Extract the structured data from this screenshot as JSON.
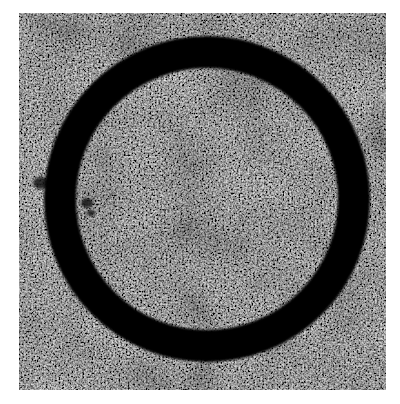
{
  "image": {
    "description": "Grayscale textured surface with a thick dark circular ring",
    "background_color": "#ffffff",
    "texture": {
      "base_color": "#5a5a5a",
      "speckle_light": "#9a9a9a",
      "speckle_dark": "#2a2a2a",
      "bounds": {
        "x": 19,
        "y": 13,
        "width": 367,
        "height": 377
      }
    },
    "ring": {
      "color": "#050505",
      "center_x": 188,
      "center_y": 186,
      "outer_radius": 163,
      "thickness": 32
    },
    "dark_spots": [
      {
        "x": 22,
        "y": 170,
        "rx": 8,
        "ry": 6
      },
      {
        "x": 68,
        "y": 190,
        "rx": 6,
        "ry": 5
      },
      {
        "x": 72,
        "y": 200,
        "rx": 4,
        "ry": 3
      }
    ]
  }
}
